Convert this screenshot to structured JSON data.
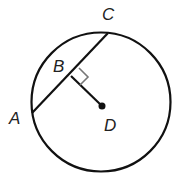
{
  "diagram": {
    "type": "circle-chord-perpendicular",
    "labels": {
      "A": "A",
      "B": "B",
      "C": "C",
      "D": "D"
    },
    "relations": [
      "AC is a chord of the circle",
      "D is the center of the circle",
      "BD is perpendicular to AC at B"
    ],
    "colors": {
      "stroke": "#111111",
      "right_angle_marker": "#777777",
      "label": "#222222"
    }
  }
}
